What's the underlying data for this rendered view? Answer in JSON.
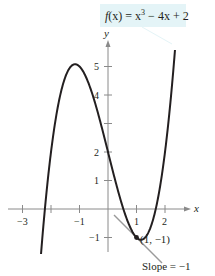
{
  "chart_data": {
    "type": "line",
    "function": "x^3 - 4x + 2",
    "xlabel": "x",
    "ylabel": "y",
    "xlim": [
      -3.5,
      2.9
    ],
    "ylim": [
      -1.6,
      5.8
    ],
    "grid": false,
    "x_ticks": [
      -3,
      -1,
      1,
      2
    ],
    "y_ticks": [
      -1,
      1,
      2,
      5,
      4,
      3
    ],
    "x_tick_labels": [
      "−3",
      "−1",
      "1",
      "2"
    ],
    "y_tick_labels": [
      "−1",
      "1",
      "2",
      "4",
      "5"
    ],
    "series": [
      {
        "name": "f(x) = x^3 − 4x + 2",
        "x": [
          -2.35,
          -2.0,
          -1.5,
          -1.155,
          -1.0,
          -0.5,
          0.0,
          0.5,
          1.0,
          1.155,
          1.5,
          2.0,
          2.35
        ],
        "y": [
          -1.58,
          2.0,
          4.63,
          5.08,
          5.0,
          3.88,
          2.0,
          0.13,
          -1.0,
          -1.08,
          -0.63,
          2.0,
          5.58
        ]
      },
      {
        "name": "tangent line at (1, −1)",
        "x": [
          0.2,
          1.9
        ],
        "y": [
          -0.2,
          -1.9
        ],
        "slope": -1
      }
    ],
    "annotations": [
      {
        "text": "(1, −1)",
        "x": 1,
        "y": -1,
        "type": "point"
      },
      {
        "text": "Slope = −1",
        "type": "label"
      },
      {
        "text": "f(x) = x³ − 4x + 2",
        "type": "callout"
      }
    ]
  },
  "labels": {
    "func_f": "f",
    "func_x": "(x) = x",
    "func_exp": "3",
    "func_rest": " − 4x + 2",
    "point": "(1, −1)",
    "slope": "Slope = −1",
    "x_axis": "x",
    "y_axis": "y",
    "tick_x_m3": "−3",
    "tick_x_m1": "−1",
    "tick_x_1": "1",
    "tick_x_2": "2",
    "tick_y_m1": "−1",
    "tick_y_1": "1",
    "tick_y_2": "2",
    "tick_y_4": "4",
    "tick_y_5": "5"
  },
  "colors": {
    "curve": "#231f20",
    "axis": "#8a8a8a",
    "tangent": "#9a9a9a",
    "callout_bg": "#e4f4f7"
  }
}
